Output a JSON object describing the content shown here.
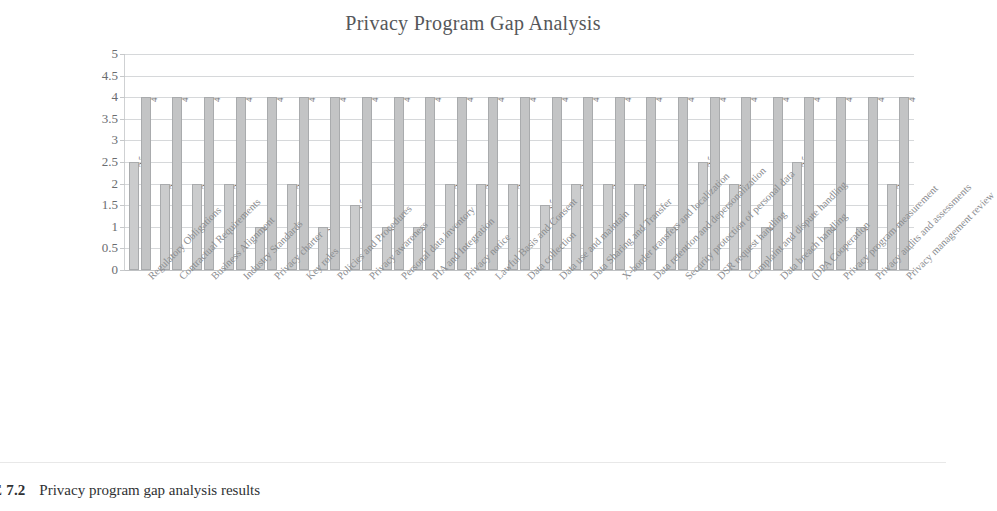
{
  "chart_data": {
    "type": "bar",
    "title": "Privacy Program Gap Analysis",
    "xlabel": "",
    "ylabel": "",
    "ylim": [
      0,
      5
    ],
    "ytick_labels": [
      "5",
      "4.5",
      "4",
      "3.5",
      "3",
      "2.5",
      "2",
      "1.5",
      "1",
      "0.5",
      "0"
    ],
    "ytick_values": [
      5,
      4.5,
      4,
      3.5,
      3,
      2.5,
      2,
      1.5,
      1,
      0.5,
      0
    ],
    "grid": true,
    "legend": "none",
    "show_data_labels": true,
    "categories": [
      "Regulatory Obligations",
      "Contractual Requirements",
      "Business Alignment",
      "Industry Standards",
      "Privacy charter",
      "Key roles",
      "Policies and Procedures",
      "Privacy awareness",
      "Personal data inventory",
      "PIA and Integration",
      "Privacy notice",
      "Lawful Basis and Consent",
      "Data collection",
      "Data use and maintain",
      "Data Sharing and Transfer",
      "X-border transfers and localization",
      "Data retention and depersonalization",
      "Security protection of personal data",
      "DSR request handling",
      "Complaint and dispute handling",
      "Data breach handling",
      "(DPA Cooperation",
      "Privacy program measurement",
      "Privacy audits and assessments",
      "Privacy management review"
    ],
    "series": [
      {
        "name": "Current",
        "color": "#cbcccd",
        "values": [
          2.5,
          2,
          2,
          2,
          1,
          2,
          1,
          1.5,
          1,
          1,
          2,
          2,
          2,
          1.5,
          2,
          2,
          2,
          1,
          2.5,
          2,
          1,
          2.5,
          1,
          1,
          2
        ]
      },
      {
        "name": "Target",
        "color": "#c3c4c5",
        "values": [
          4,
          4,
          4,
          4,
          4,
          4,
          4,
          4,
          4,
          4,
          4,
          4,
          4,
          4,
          4,
          4,
          4,
          4,
          4,
          4,
          4,
          4,
          4,
          4,
          4
        ]
      }
    ]
  },
  "caption": {
    "number": "URE 7.2",
    "text": "Privacy program gap analysis results"
  }
}
